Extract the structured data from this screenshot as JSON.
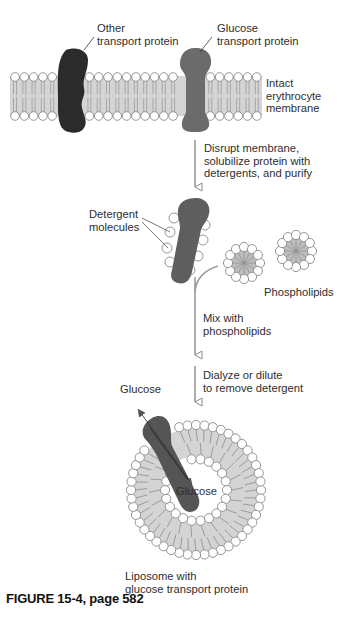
{
  "figure": {
    "caption": "FIGURE 15-4, page 582",
    "colors": {
      "membrane_core": "#d4d4d4",
      "head_fill": "#ffffff",
      "head_stroke": "#8a8a8a",
      "other_protein": "#2b2b2b",
      "glucose_protein": "#6b6b6b",
      "arrow": "#9a9a9a"
    }
  },
  "labels": {
    "other_protein": [
      "Other",
      "transport protein"
    ],
    "glucose_protein": [
      "Glucose",
      "transport protein"
    ],
    "membrane": [
      "Intact",
      "erythrocyte",
      "membrane"
    ],
    "step1": [
      "Disrupt membrane,",
      "solubilize protein with",
      "detergents, and purify"
    ],
    "detergent": [
      "Detergent",
      "molecules"
    ],
    "phospholipids": "Phospholipids",
    "step2": [
      "Mix with",
      "phospholipids"
    ],
    "step3": [
      "Dialyze or dilute",
      "to remove detergent"
    ],
    "glucose_outside": "Glucose",
    "glucose_inside": "Glucose",
    "liposome": [
      "Liposome with",
      "glucose transport protein"
    ]
  }
}
